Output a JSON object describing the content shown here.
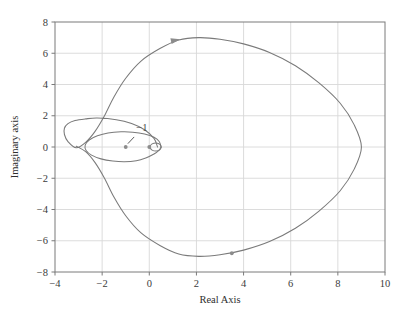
{
  "chart_data": {
    "type": "line",
    "title": "",
    "xlabel": "Real Axis",
    "ylabel": "Imaginary axis",
    "xlim": [
      -4,
      10
    ],
    "ylim": [
      -8,
      8
    ],
    "xticks": [
      -4,
      -2,
      0,
      2,
      4,
      6,
      8,
      10
    ],
    "yticks": [
      -8,
      -6,
      -4,
      -2,
      0,
      2,
      4,
      6,
      8
    ],
    "xtick_labels": [
      "−4",
      "−2",
      "0",
      "2",
      "4",
      "6",
      "8",
      "10"
    ],
    "ytick_labels": [
      "−8",
      "−6",
      "−4",
      "−2",
      "0",
      "2",
      "4",
      "6",
      "8"
    ],
    "grid": true,
    "legend": null,
    "line_color": "#7a7a7a",
    "grid_color": "#d8d8d8",
    "frame_color": "#7a7a7a",
    "series": [
      {
        "name": "nyquist-outer-contour",
        "comment": "Large outer Nyquist loop, peak Im 7 near Re 2, right extent Re 9, left extent Re -3.6",
        "points": [
          [
            0.35,
            0.0
          ],
          [
            0.2,
            0.55
          ],
          [
            -0.2,
            1.1
          ],
          [
            -0.75,
            1.5
          ],
          [
            -1.4,
            1.75
          ],
          [
            -2.2,
            1.85
          ],
          [
            -2.7,
            1.8
          ],
          [
            -3.15,
            1.7
          ],
          [
            -3.45,
            1.5
          ],
          [
            -3.6,
            1.2
          ],
          [
            -3.6,
            0.8
          ],
          [
            -3.45,
            0.35
          ],
          [
            -3.1,
            -0.05
          ],
          [
            -2.7,
            0.3
          ],
          [
            -2.3,
            1.0
          ],
          [
            -1.9,
            2.0
          ],
          [
            -1.5,
            3.2
          ],
          [
            -1.0,
            4.4
          ],
          [
            -0.35,
            5.5
          ],
          [
            0.45,
            6.3
          ],
          [
            1.25,
            6.85
          ],
          [
            2.1,
            7.0
          ],
          [
            3.0,
            6.9
          ],
          [
            4.0,
            6.6
          ],
          [
            5.1,
            6.05
          ],
          [
            6.2,
            5.2
          ],
          [
            7.2,
            4.1
          ],
          [
            8.1,
            2.8
          ],
          [
            8.7,
            1.4
          ],
          [
            9.0,
            0.0
          ],
          [
            8.7,
            -1.4
          ],
          [
            8.1,
            -2.8
          ],
          [
            7.2,
            -4.1
          ],
          [
            6.2,
            -5.2
          ],
          [
            5.1,
            -6.05
          ],
          [
            4.0,
            -6.6
          ],
          [
            3.0,
            -6.9
          ],
          [
            2.1,
            -7.0
          ],
          [
            1.25,
            -6.85
          ],
          [
            0.45,
            -6.3
          ],
          [
            -0.35,
            -5.5
          ],
          [
            -1.0,
            -4.4
          ],
          [
            -1.5,
            -3.2
          ],
          [
            -1.9,
            -2.0
          ],
          [
            -2.3,
            -1.0
          ],
          [
            -2.7,
            -0.3
          ],
          [
            -3.1,
            0.05
          ]
        ]
      },
      {
        "name": "nyquist-inner-ellipse",
        "comment": "Inner ellipse centred near Re -1.1, Im 0, semi-axes ~1.6 x 0.95",
        "points": [
          [
            0.5,
            0.0
          ],
          [
            0.42,
            0.35
          ],
          [
            0.2,
            0.62
          ],
          [
            -0.2,
            0.83
          ],
          [
            -0.7,
            0.95
          ],
          [
            -1.2,
            0.97
          ],
          [
            -1.75,
            0.9
          ],
          [
            -2.2,
            0.72
          ],
          [
            -2.55,
            0.45
          ],
          [
            -2.72,
            0.12
          ],
          [
            -2.68,
            -0.22
          ],
          [
            -2.45,
            -0.52
          ],
          [
            -2.05,
            -0.76
          ],
          [
            -1.55,
            -0.9
          ],
          [
            -1.05,
            -0.95
          ],
          [
            -0.55,
            -0.88
          ],
          [
            -0.15,
            -0.7
          ],
          [
            0.2,
            -0.45
          ],
          [
            0.42,
            -0.2
          ],
          [
            0.5,
            0.0
          ]
        ]
      },
      {
        "name": "nyquist-origin-loop",
        "comment": "Small loop just right of the origin",
        "points": [
          [
            0.0,
            0.0
          ],
          [
            0.12,
            0.2
          ],
          [
            0.3,
            0.26
          ],
          [
            0.45,
            0.17
          ],
          [
            0.5,
            0.0
          ],
          [
            0.45,
            -0.17
          ],
          [
            0.3,
            -0.26
          ],
          [
            0.12,
            -0.2
          ],
          [
            0.0,
            0.0
          ]
        ]
      }
    ],
    "markers": [
      {
        "name": "critical-point-marker",
        "x": -1.0,
        "y": 0.0,
        "shape": "dot",
        "color": "#8c8c8c"
      },
      {
        "name": "origin-marker",
        "x": 0.0,
        "y": 0.0,
        "shape": "dot",
        "color": "#8c8c8c"
      },
      {
        "name": "direction-marker-lower",
        "x": 3.5,
        "y": -6.8,
        "shape": "dot",
        "color": "#8c8c8c"
      }
    ],
    "arrows": [
      {
        "name": "direction-arrow-upper",
        "x": 1.15,
        "y": 6.85,
        "angle_deg": -12,
        "color": "#8c8c8c"
      }
    ],
    "annotations": [
      {
        "name": "critical-point-label",
        "text": "−1",
        "x": -0.55,
        "y": 1.05,
        "leader_to_x": -1.0,
        "leader_to_y": 0.0,
        "color": "#4a4a4a"
      }
    ]
  }
}
